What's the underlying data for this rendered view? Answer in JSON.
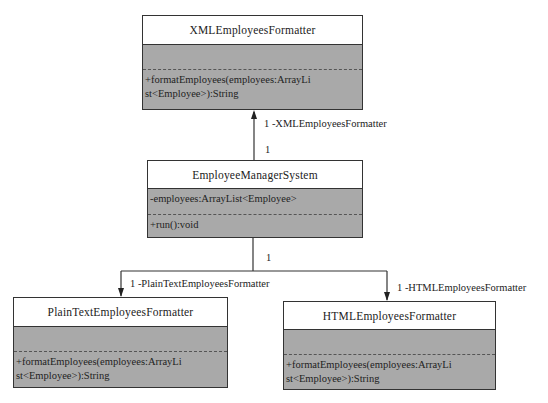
{
  "diagram": {
    "type": "UML class diagram",
    "classes": [
      {
        "id": "xml",
        "name": "XMLEmployeesFormatter",
        "attributes": [],
        "operations": [
          "+formatEmployees(employees:ArrayLi",
          "st<Employee>):String"
        ]
      },
      {
        "id": "ems",
        "name": "EmployeeManagerSystem",
        "attributes": [
          "-employees:ArrayList<Employee>"
        ],
        "operations": [
          "+run():void"
        ]
      },
      {
        "id": "plain",
        "name": "PlainTextEmployeesFormatter",
        "attributes": [],
        "operations": [
          "+formatEmployees(employees:ArrayLi",
          "st<Employee>):String"
        ]
      },
      {
        "id": "html",
        "name": "HTMLEmployeesFormatter",
        "attributes": [],
        "operations": [
          "+formatEmployees(employees:ArrayLi",
          "st<Employee>):String"
        ]
      }
    ],
    "associations": [
      {
        "from": "EmployeeManagerSystem",
        "to": "XMLEmployeesFormatter",
        "source_mult": "1",
        "target_mult": "1",
        "role": "-XMLEmployeesFormatter"
      },
      {
        "from": "EmployeeManagerSystem",
        "to": "PlainTextEmployeesFormatter",
        "source_mult": "1",
        "target_mult": "1",
        "role": "-PlainTextEmployeesFormatter"
      },
      {
        "from": "EmployeeManagerSystem",
        "to": "HTMLEmployeesFormatter",
        "source_mult": "1",
        "target_mult": "1",
        "role": "-HTMLEmployeesFormatter"
      }
    ],
    "labels": {
      "xml_role": "1  -XMLEmployeesFormatter",
      "xml_src_mult": "1",
      "down_src_mult": "1",
      "plain_role": "1  -PlainTextEmployeesFormatter",
      "html_role": "1 -HTMLEmployeesFormatter"
    },
    "colors": {
      "body_fill": "#a9a9a9",
      "header_fill": "#ffffff",
      "line": "#333333"
    }
  }
}
